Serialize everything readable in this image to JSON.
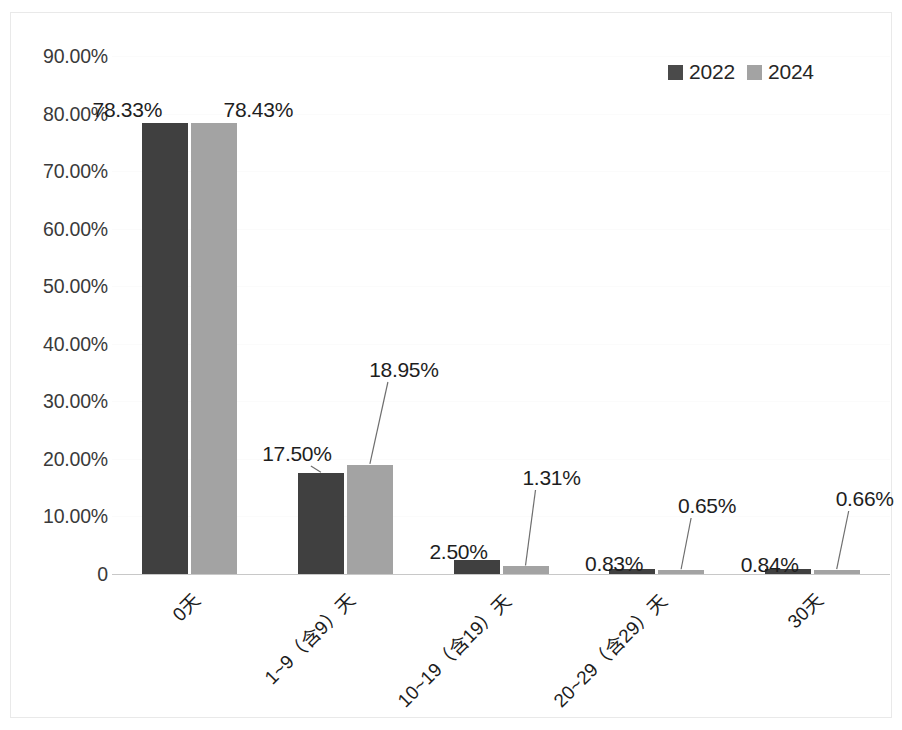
{
  "chart_data": {
    "type": "bar",
    "title": "",
    "subtitle": "",
    "xlabel": "",
    "ylabel": "",
    "grid": true,
    "legend_position": "top-right",
    "ylim": [
      0,
      90
    ],
    "ytick_labels": [
      "90.00%",
      "80.00%",
      "70.00%",
      "60.00%",
      "50.00%",
      "40.00%",
      "30.00%",
      "20.00%",
      "10.00%",
      "0"
    ],
    "ytick_values": [
      90,
      80,
      70,
      60,
      50,
      40,
      30,
      20,
      10,
      0
    ],
    "categories": [
      "0天",
      "1~9（含9）天",
      "10~19（含19）天",
      "20~29（含29）天",
      "30天"
    ],
    "series": [
      {
        "name": "2022",
        "color": "#404040",
        "values": [
          78.33,
          17.5,
          2.5,
          0.83,
          0.84
        ],
        "labels": [
          "78.33%",
          "17.50%",
          "2.50%",
          "0.83%",
          "0.84%"
        ]
      },
      {
        "name": "2024",
        "color": "#a3a3a3",
        "values": [
          78.43,
          18.95,
          1.31,
          0.65,
          0.66
        ],
        "labels": [
          "78.43%",
          "18.95%",
          "1.31%",
          "0.65%",
          "0.66%"
        ]
      }
    ]
  },
  "legend": {
    "items": [
      {
        "label": "2022",
        "color": "#404040"
      },
      {
        "label": "2024",
        "color": "#a3a3a3"
      }
    ]
  },
  "axis": {
    "y_ticks": [
      {
        "label": "90.00%",
        "value": 90
      },
      {
        "label": "80.00%",
        "value": 80
      },
      {
        "label": "70.00%",
        "value": 70
      },
      {
        "label": "60.00%",
        "value": 60
      },
      {
        "label": "50.00%",
        "value": 50
      },
      {
        "label": "40.00%",
        "value": 40
      },
      {
        "label": "30.00%",
        "value": 30
      },
      {
        "label": "20.00%",
        "value": 20
      },
      {
        "label": "10.00%",
        "value": 10
      },
      {
        "label": "0",
        "value": 0
      }
    ],
    "x_categories": [
      {
        "label": "0天"
      },
      {
        "label": "1~9（含9）天"
      },
      {
        "label": "10~19（含19）天"
      },
      {
        "label": "20~29（含29）天"
      },
      {
        "label": "30天"
      }
    ]
  }
}
